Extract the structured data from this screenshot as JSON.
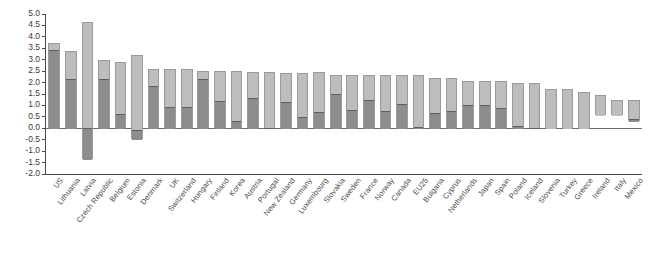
{
  "chart_data": {
    "type": "bar",
    "title": "",
    "subtitle": "",
    "xlabel": "",
    "ylabel": "",
    "ylim": [
      -2.0,
      5.0
    ],
    "ytick_step": 0.5,
    "yticks": [
      "5.0",
      "4.5",
      "4.0",
      "3.5",
      "3.0",
      "2.5",
      "2.0",
      "1.5",
      "1.0",
      "0.5",
      "0.0",
      "-0.5",
      "-1.0",
      "-1.5",
      "-2.0"
    ],
    "grid": false,
    "legend": [],
    "legend_position": "none",
    "colors": {
      "segment_dark": "#8d8d8d",
      "segment_light": "#bdbdbd",
      "bar_border": "#9a9a9a",
      "split_line": "#5f5f5f",
      "axis": "#4a4a4a",
      "background": "#ffffff"
    },
    "categories": [
      "US",
      "Lithuania",
      "Latvia",
      "Czech Republic",
      "Belgium",
      "Estonia",
      "Denmark",
      "UK",
      "Switzerland",
      "Hungary",
      "Finland",
      "Korea",
      "Austria",
      "Portugal",
      "New Zealand",
      "Germany",
      "Luxembourg",
      "Slovakia",
      "Sweden",
      "France",
      "Norway",
      "Canada",
      "EU25",
      "Bulgaria",
      "Cyprus",
      "Netherlands",
      "Japan",
      "Spain",
      "Poland",
      "Iceland",
      "Slovenia",
      "Turkey",
      "Greece",
      "Ireland",
      "Italy",
      "Mexico"
    ],
    "series": [
      {
        "name": "range-top",
        "values": [
          3.75,
          3.4,
          4.65,
          3.0,
          2.92,
          3.22,
          2.6,
          2.6,
          2.6,
          2.52,
          2.5,
          2.52,
          2.45,
          2.45,
          2.4,
          2.42,
          2.45,
          2.35,
          2.35,
          2.35,
          2.32,
          2.32,
          2.35,
          2.18,
          2.18,
          2.08,
          2.08,
          2.08,
          2.0,
          2.0,
          1.7,
          1.7,
          1.6,
          1.45,
          1.22,
          1.22
        ]
      },
      {
        "name": "range-bottom",
        "values": [
          0.0,
          0.0,
          -1.35,
          0.0,
          0.0,
          -0.45,
          0.0,
          0.0,
          0.0,
          0.0,
          0.0,
          0.0,
          0.0,
          0.0,
          0.0,
          0.0,
          0.0,
          0.0,
          0.0,
          0.0,
          0.0,
          0.0,
          0.0,
          0.0,
          0.0,
          0.0,
          0.0,
          0.0,
          0.0,
          0.0,
          0.0,
          0.0,
          0.0,
          0.6,
          0.6,
          0.3
        ]
      },
      {
        "name": "split-value",
        "values": [
          3.45,
          2.2,
          0.05,
          2.2,
          0.65,
          -0.05,
          1.9,
          0.97,
          0.97,
          2.2,
          1.25,
          0.35,
          1.35,
          0.05,
          1.2,
          0.55,
          0.75,
          1.55,
          0.85,
          1.3,
          0.82,
          1.1,
          0.08,
          0.7,
          0.8,
          1.05,
          1.05,
          0.95,
          0.15,
          0.05,
          0.0,
          0.0,
          0.0,
          0.6,
          0.6,
          0.45
        ]
      }
    ]
  }
}
